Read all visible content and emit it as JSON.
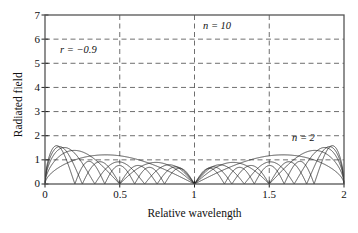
{
  "chart_data": {
    "type": "line",
    "title": "",
    "subtitle": "",
    "xlabel": "Relative wavelength",
    "ylabel": "Radiated field",
    "xlim": [
      0,
      2
    ],
    "ylim": [
      0,
      7
    ],
    "xticks": [
      "0",
      "0.5",
      "1",
      "1.5",
      "2"
    ],
    "xtick_values": [
      0,
      0.5,
      1,
      1.5,
      2
    ],
    "yticks": [
      "0",
      "1",
      "2",
      "3",
      "4",
      "5",
      "6",
      "7"
    ],
    "ytick_values": [
      0,
      1,
      2,
      3,
      4,
      5,
      6,
      7
    ],
    "grid": true,
    "grid_style": "dashed",
    "grid_x_values": [
      0.5,
      1,
      1.5
    ],
    "grid_y_values": [
      1,
      2,
      3,
      4,
      5,
      6
    ],
    "legend": "none",
    "legend_position": "inline-annotations",
    "line_color": "#1a1a1a",
    "frame_color": "#555555",
    "background": "#ffffff",
    "annotations": [
      {
        "text": "r = −0.9",
        "x": 0.12,
        "y": 5.6
      },
      {
        "text": "n = 10",
        "x": 1.06,
        "y": 6.72
      },
      {
        "text": "n = 2",
        "x": 1.66,
        "y": 2.28
      }
    ],
    "series": [
      {
        "name": "n = 10",
        "n": 10,
        "peak_value": 6.55,
        "peak_x": 1.0,
        "sidelobe_level": 0.95,
        "values_at_ticks": {
          "0": 0.15,
          "0.5": 0.62,
          "1": 6.55,
          "1.5": 0.62,
          "2": 0.15
        }
      },
      {
        "name": "n = 8",
        "n": 8,
        "peak_value": 5.65,
        "peak_x": 1.0,
        "sidelobe_level": 0.95,
        "values_at_ticks": {
          "0": 0.15,
          "0.5": 0.95,
          "1": 5.65,
          "1.5": 0.95,
          "2": 0.15
        }
      },
      {
        "name": "n = 6",
        "n": 6,
        "peak_value": 4.7,
        "peak_x": 1.0,
        "sidelobe_level": 0.9,
        "values_at_ticks": {
          "0": 0.15,
          "0.5": 0.35,
          "1": 4.7,
          "1.5": 0.35,
          "2": 0.15
        }
      },
      {
        "name": "n = 4",
        "n": 4,
        "peak_value": 3.45,
        "peak_x": 1.0,
        "sidelobe_level": 0.85,
        "values_at_ticks": {
          "0": 0.15,
          "0.5": 0.85,
          "1": 3.45,
          "1.5": 0.85,
          "2": 0.15
        }
      },
      {
        "name": "n = 2",
        "n": 2,
        "peak_value": 2.0,
        "peak_x": 1.0,
        "sidelobe_level": 0.0,
        "values_at_ticks": {
          "0": 0.15,
          "0.5": 1.42,
          "1": 2.0,
          "1.5": 1.42,
          "2": 0.15
        }
      }
    ]
  },
  "axes": {
    "ylabel": "Radiated field",
    "xlabel": "Relative wavelength",
    "ytick_labels": [
      "7",
      "6",
      "5",
      "4",
      "3",
      "2",
      "1",
      "0"
    ],
    "xtick_labels": [
      "0",
      "0.5",
      "1",
      "1.5",
      "2"
    ]
  },
  "annotations": {
    "reflectivity": "r = −0.9",
    "n_high": "n = 10",
    "n_low": "n = 2"
  }
}
